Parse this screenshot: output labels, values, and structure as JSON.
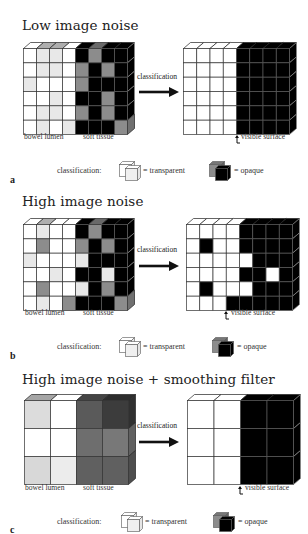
{
  "figure": {
    "panels": [
      {
        "letter": "a",
        "title": "Low image noise",
        "input_grid": {
          "cols": 8,
          "rows": 6,
          "cells": [
            [
              "#ffffff",
              "#e8e8e8",
              "#e8e8e8",
              "#ffffff",
              "#000000",
              "#8c8c8c",
              "#000000",
              "#000000"
            ],
            [
              "#ffffff",
              "#e8e8e8",
              "#e8e8e8",
              "#ffffff",
              "#8c8c8c",
              "#000000",
              "#8c8c8c",
              "#000000"
            ],
            [
              "#e8e8e8",
              "#ffffff",
              "#ffffff",
              "#ffffff",
              "#8c8c8c",
              "#000000",
              "#000000",
              "#000000"
            ],
            [
              "#ffffff",
              "#ffffff",
              "#e8e8e8",
              "#ffffff",
              "#000000",
              "#000000",
              "#8c8c8c",
              "#000000"
            ],
            [
              "#ffffff",
              "#e8e8e8",
              "#e8e8e8",
              "#ffffff",
              "#8c8c8c",
              "#000000",
              "#8c8c8c",
              "#000000"
            ],
            [
              "#ffffff",
              "#e8e8e8",
              "#ffffff",
              "#e8e8e8",
              "#000000",
              "#000000",
              "#000000",
              "#8c8c8c"
            ]
          ],
          "labels": [
            "bowel lumen",
            "soft tissue"
          ]
        },
        "arrow_label": "classification",
        "output_grid": {
          "cols": 8,
          "rows": 6,
          "cells": [
            [
              "#ffffff",
              "#ffffff",
              "#ffffff",
              "#ffffff",
              "#000000",
              "#000000",
              "#000000",
              "#000000"
            ],
            [
              "#ffffff",
              "#ffffff",
              "#ffffff",
              "#ffffff",
              "#000000",
              "#000000",
              "#000000",
              "#000000"
            ],
            [
              "#ffffff",
              "#ffffff",
              "#ffffff",
              "#ffffff",
              "#000000",
              "#000000",
              "#000000",
              "#000000"
            ],
            [
              "#ffffff",
              "#ffffff",
              "#ffffff",
              "#ffffff",
              "#000000",
              "#000000",
              "#000000",
              "#000000"
            ],
            [
              "#ffffff",
              "#ffffff",
              "#ffffff",
              "#ffffff",
              "#000000",
              "#000000",
              "#000000",
              "#000000"
            ],
            [
              "#ffffff",
              "#ffffff",
              "#ffffff",
              "#ffffff",
              "#000000",
              "#000000",
              "#000000",
              "#000000"
            ]
          ],
          "surface_label": "visible surface"
        },
        "legend": {
          "prefix": "classification:",
          "transparent": "= transparent",
          "opaque": "= opaque"
        }
      },
      {
        "letter": "b",
        "title": "High image noise",
        "input_grid": {
          "cols": 8,
          "rows": 6,
          "cells": [
            [
              "#ffffff",
              "#e8e8e8",
              "#ffffff",
              "#ffffff",
              "#000000",
              "#8c8c8c",
              "#000000",
              "#000000"
            ],
            [
              "#ffffff",
              "#8c8c8c",
              "#ffffff",
              "#ffffff",
              "#8c8c8c",
              "#000000",
              "#8c8c8c",
              "#000000"
            ],
            [
              "#e8e8e8",
              "#ffffff",
              "#ffffff",
              "#ffffff",
              "#e8e8e8",
              "#000000",
              "#000000",
              "#000000"
            ],
            [
              "#ffffff",
              "#ffffff",
              "#e8e8e8",
              "#ffffff",
              "#000000",
              "#000000",
              "#e8e8e8",
              "#000000"
            ],
            [
              "#ffffff",
              "#8c8c8c",
              "#ffffff",
              "#ffffff",
              "#e8e8e8",
              "#000000",
              "#8c8c8c",
              "#000000"
            ],
            [
              "#ffffff",
              "#e8e8e8",
              "#ffffff",
              "#8c8c8c",
              "#000000",
              "#000000",
              "#000000",
              "#8c8c8c"
            ]
          ],
          "labels": [
            "bowel lumen",
            "soft tissue"
          ]
        },
        "arrow_label": "classification",
        "output_grid": {
          "cols": 8,
          "rows": 6,
          "cells": [
            [
              "#ffffff",
              "#ffffff",
              "#ffffff",
              "#ffffff",
              "#000000",
              "#000000",
              "#000000",
              "#000000"
            ],
            [
              "#ffffff",
              "#000000",
              "#ffffff",
              "#ffffff",
              "#000000",
              "#000000",
              "#000000",
              "#000000"
            ],
            [
              "#ffffff",
              "#ffffff",
              "#ffffff",
              "#ffffff",
              "#ffffff",
              "#000000",
              "#000000",
              "#000000"
            ],
            [
              "#ffffff",
              "#ffffff",
              "#ffffff",
              "#ffffff",
              "#000000",
              "#000000",
              "#ffffff",
              "#000000"
            ],
            [
              "#ffffff",
              "#000000",
              "#ffffff",
              "#ffffff",
              "#ffffff",
              "#000000",
              "#000000",
              "#000000"
            ],
            [
              "#ffffff",
              "#ffffff",
              "#ffffff",
              "#000000",
              "#000000",
              "#000000",
              "#000000",
              "#000000"
            ]
          ],
          "surface_label": "visible surface"
        },
        "legend": {
          "prefix": "classification:",
          "transparent": "= transparent",
          "opaque": "= opaque"
        }
      },
      {
        "letter": "c",
        "title": "High image noise + smoothing filter",
        "input_grid": {
          "cols": 4,
          "rows": 3,
          "cells": [
            [
              "#dcdcdc",
              "#ffffff",
              "#5a5a5a",
              "#3c3c3c"
            ],
            [
              "#ffffff",
              "#ffffff",
              "#6e6e6e",
              "#787878"
            ],
            [
              "#d8d8d8",
              "#ececec",
              "#606060",
              "#606060"
            ]
          ],
          "labels": [
            "bowel lumen",
            "soft tissue"
          ]
        },
        "arrow_label": "classification",
        "output_grid": {
          "cols": 4,
          "rows": 3,
          "cells": [
            [
              "#ffffff",
              "#ffffff",
              "#000000",
              "#000000"
            ],
            [
              "#ffffff",
              "#ffffff",
              "#000000",
              "#000000"
            ],
            [
              "#ffffff",
              "#ffffff",
              "#000000",
              "#000000"
            ]
          ],
          "surface_label": "visible surface"
        },
        "legend": {
          "prefix": "classification:",
          "transparent": "= transparent",
          "opaque": "= opaque"
        }
      }
    ]
  }
}
